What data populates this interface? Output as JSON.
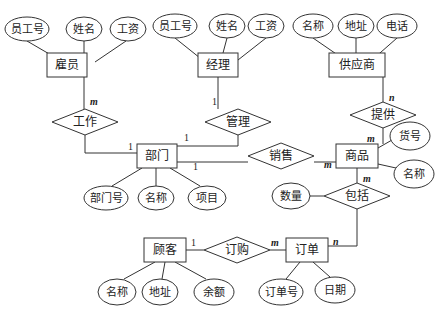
{
  "diagram": {
    "type": "er-diagram",
    "entities": [
      {
        "id": "guyuan",
        "label": "雇员",
        "x": 67,
        "y": 65,
        "w": 40,
        "h": 24
      },
      {
        "id": "jingli",
        "label": "经理",
        "x": 218,
        "y": 65,
        "w": 40,
        "h": 24
      },
      {
        "id": "gongyingshang",
        "label": "供应商",
        "x": 357,
        "y": 65,
        "w": 56,
        "h": 24
      },
      {
        "id": "bumen",
        "label": "部门",
        "x": 157,
        "y": 156,
        "w": 40,
        "h": 24
      },
      {
        "id": "shangpin",
        "label": "商品",
        "x": 357,
        "y": 156,
        "w": 42,
        "h": 24
      },
      {
        "id": "guke",
        "label": "顾客",
        "x": 165,
        "y": 250,
        "w": 42,
        "h": 24
      },
      {
        "id": "dingdan",
        "label": "订单",
        "x": 307,
        "y": 250,
        "w": 42,
        "h": 24
      }
    ],
    "relationships": [
      {
        "id": "gongzuo",
        "label": "工作",
        "x": 85,
        "y": 122,
        "w": 66,
        "h": 26
      },
      {
        "id": "guanli",
        "label": "管理",
        "x": 238,
        "y": 122,
        "w": 66,
        "h": 26
      },
      {
        "id": "tigong",
        "label": "提供",
        "x": 383,
        "y": 115,
        "w": 66,
        "h": 26
      },
      {
        "id": "xiaoshou",
        "label": "销售",
        "x": 281,
        "y": 156,
        "w": 66,
        "h": 26
      },
      {
        "id": "baokuo",
        "label": "包括",
        "x": 357,
        "y": 196,
        "w": 66,
        "h": 26
      },
      {
        "id": "dinggou",
        "label": "订购",
        "x": 237,
        "y": 250,
        "w": 66,
        "h": 26
      }
    ],
    "attributes": [
      {
        "label": "员工号",
        "x": 27,
        "y": 29,
        "rx": 22,
        "ry": 12,
        "of": "guyuan"
      },
      {
        "label": "姓名",
        "x": 84,
        "y": 29,
        "rx": 18,
        "ry": 12,
        "of": "guyuan"
      },
      {
        "label": "工资",
        "x": 128,
        "y": 29,
        "rx": 18,
        "ry": 12,
        "of": "guyuan"
      },
      {
        "label": "员工号",
        "x": 175,
        "y": 26,
        "rx": 22,
        "ry": 12,
        "of": "jingli"
      },
      {
        "label": "姓名",
        "x": 227,
        "y": 26,
        "rx": 18,
        "ry": 12,
        "of": "jingli"
      },
      {
        "label": "工资",
        "x": 266,
        "y": 26,
        "rx": 18,
        "ry": 12,
        "of": "jingli"
      },
      {
        "label": "名称",
        "x": 313,
        "y": 26,
        "rx": 20,
        "ry": 12,
        "of": "gongyingshang"
      },
      {
        "label": "地址",
        "x": 356,
        "y": 26,
        "rx": 18,
        "ry": 12,
        "of": "gongyingshang"
      },
      {
        "label": "电话",
        "x": 397,
        "y": 26,
        "rx": 20,
        "ry": 12,
        "of": "gongyingshang"
      },
      {
        "label": "部门号",
        "x": 106,
        "y": 198,
        "rx": 22,
        "ry": 12,
        "of": "bumen"
      },
      {
        "label": "名称",
        "x": 156,
        "y": 198,
        "rx": 18,
        "ry": 12,
        "of": "bumen"
      },
      {
        "label": "项目",
        "x": 207,
        "y": 198,
        "rx": 19,
        "ry": 12,
        "of": "bumen"
      },
      {
        "label": "货号",
        "x": 410,
        "y": 136,
        "rx": 20,
        "ry": 14,
        "of": "shangpin"
      },
      {
        "label": "名称",
        "x": 414,
        "y": 174,
        "rx": 20,
        "ry": 14,
        "of": "shangpin"
      },
      {
        "label": "数量",
        "x": 291,
        "y": 196,
        "rx": 19,
        "ry": 13,
        "of": "baokuo"
      },
      {
        "label": "名称",
        "x": 117,
        "y": 292,
        "rx": 19,
        "ry": 13,
        "of": "guke"
      },
      {
        "label": "地址",
        "x": 160,
        "y": 292,
        "rx": 18,
        "ry": 13,
        "of": "guke"
      },
      {
        "label": "余额",
        "x": 214,
        "y": 292,
        "rx": 20,
        "ry": 13,
        "of": "guke"
      },
      {
        "label": "订单号",
        "x": 281,
        "y": 292,
        "rx": 22,
        "ry": 13,
        "of": "dingdan"
      },
      {
        "label": "日期",
        "x": 335,
        "y": 290,
        "rx": 20,
        "ry": 13,
        "of": "dingdan"
      }
    ],
    "edges": [
      {
        "path": "M27,41 L75,69"
      },
      {
        "path": "M84,41 L84,53"
      },
      {
        "path": "M126,41 L95,62"
      },
      {
        "path": "M175,38 L210,66"
      },
      {
        "path": "M227,38 L223,53"
      },
      {
        "path": "M266,38 L238,60"
      },
      {
        "path": "M313,38 L345,60"
      },
      {
        "path": "M356,38 L356,53"
      },
      {
        "path": "M397,38 L372,60"
      },
      {
        "path": "M84,77 L84,109"
      },
      {
        "path": "M85,135 L85,153 L137,153"
      },
      {
        "path": "M218,77 L218,109"
      },
      {
        "path": "M238,135 L238,146 L177,146"
      },
      {
        "path": "M383,77 L383,102"
      },
      {
        "path": "M383,128 L383,144"
      },
      {
        "path": "M177,162 L248,162"
      },
      {
        "path": "M314,162 L336,162"
      },
      {
        "path": "M142,168 L112,186"
      },
      {
        "path": "M156,168 L156,186"
      },
      {
        "path": "M170,168 L200,186"
      },
      {
        "path": "M378,148 L392,140"
      },
      {
        "path": "M378,164 L396,168"
      },
      {
        "path": "M357,168 L357,183"
      },
      {
        "path": "M310,196 L324,196"
      },
      {
        "path": "M357,209 L357,246 L328,246"
      },
      {
        "path": "M186,250 L204,250"
      },
      {
        "path": "M270,250 L286,250"
      },
      {
        "path": "M155,262 L124,279"
      },
      {
        "path": "M165,262 L162,279"
      },
      {
        "path": "M175,262 L206,279"
      },
      {
        "path": "M300,262 L286,279"
      },
      {
        "path": "M313,262 L330,277"
      }
    ],
    "cardinalities": [
      {
        "text": "m",
        "x": 90,
        "y": 105,
        "italic": true
      },
      {
        "text": "1",
        "x": 128,
        "y": 150,
        "italic": false
      },
      {
        "text": "1",
        "x": 212,
        "y": 105,
        "italic": false
      },
      {
        "text": "1",
        "x": 184,
        "y": 141,
        "italic": false
      },
      {
        "text": "n",
        "x": 389,
        "y": 101,
        "italic": true
      },
      {
        "text": "m",
        "x": 367,
        "y": 142,
        "italic": true
      },
      {
        "text": "1",
        "x": 193,
        "y": 170,
        "italic": false
      },
      {
        "text": "m",
        "x": 324,
        "y": 168,
        "italic": true
      },
      {
        "text": "m",
        "x": 363,
        "y": 182,
        "italic": true
      },
      {
        "text": "1",
        "x": 191,
        "y": 246,
        "italic": false
      },
      {
        "text": "m",
        "x": 271,
        "y": 246,
        "italic": true
      },
      {
        "text": "n",
        "x": 333,
        "y": 245,
        "italic": true
      }
    ]
  }
}
